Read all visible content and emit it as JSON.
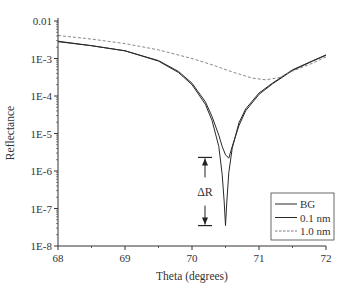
{
  "chart_data": {
    "type": "line",
    "title": "",
    "xlabel": "Theta (degrees)",
    "ylabel": "Reflectance",
    "xlim": [
      68,
      72
    ],
    "ylim": [
      1e-08,
      0.01
    ],
    "yscale": "log",
    "x_ticks": [
      68,
      69,
      70,
      71,
      72
    ],
    "x_tick_labels": [
      "68",
      "69",
      "70",
      "71",
      "72"
    ],
    "y_ticks": [
      0.01,
      0.001,
      0.0001,
      1e-05,
      1e-06,
      1e-07,
      1e-08
    ],
    "y_tick_labels": [
      "0.01",
      "1E-3",
      "1E-4",
      "1E-5",
      "1E-6",
      "1E-7",
      "1E-8"
    ],
    "grid": false,
    "legend_position": "lower right",
    "series": [
      {
        "name": "BG",
        "style": "solid",
        "x": [
          68,
          68.5,
          69,
          69.5,
          69.8,
          70,
          70.2,
          70.3,
          70.4,
          70.45,
          70.48,
          70.5,
          70.52,
          70.55,
          70.6,
          70.7,
          70.8,
          71,
          71.2,
          71.5,
          71.8,
          72
        ],
        "y": [
          0.0028,
          0.0022,
          0.0016,
          0.00085,
          0.00042,
          0.0002,
          6e-05,
          2.2e-05,
          4.5e-06,
          8e-07,
          1.5e-07,
          3.5e-08,
          1.5e-07,
          9e-07,
          4e-06,
          1.9e-05,
          4.5e-05,
          0.00012,
          0.00022,
          0.0005,
          0.00087,
          0.00125
        ]
      },
      {
        "name": "0.1 nm",
        "style": "solid",
        "x": [
          68,
          68.5,
          69,
          69.5,
          69.8,
          70,
          70.2,
          70.3,
          70.4,
          70.45,
          70.5,
          70.55,
          70.6,
          70.7,
          70.8,
          71,
          71.2,
          71.5,
          71.8,
          72
        ],
        "y": [
          0.0029,
          0.0022,
          0.0016,
          0.00088,
          0.00045,
          0.00022,
          7e-05,
          2.8e-05,
          9e-06,
          4.5e-06,
          2.7e-06,
          2.2e-06,
          4.5e-06,
          1.6e-05,
          4e-05,
          0.00011,
          0.00021,
          0.00048,
          0.00085,
          0.00122
        ]
      },
      {
        "name": "1.0 nm",
        "style": "dashed",
        "x": [
          68,
          68.5,
          69,
          69.5,
          70,
          70.3,
          70.6,
          70.9,
          71.1,
          71.3,
          71.5,
          71.8,
          72
        ],
        "y": [
          0.0041,
          0.0033,
          0.0025,
          0.0017,
          0.001,
          0.00068,
          0.00044,
          0.0003,
          0.00027,
          0.00031,
          0.00046,
          0.00075,
          0.0011
        ]
      }
    ],
    "annotations": [
      {
        "text": "ΔR",
        "type": "double-arrow",
        "x": 70.05,
        "y_top": 2.3e-06,
        "y_bottom": 3.5e-08
      }
    ]
  },
  "legend": {
    "items": [
      {
        "label": "BG",
        "style": "solid"
      },
      {
        "label": "0.1 nm",
        "style": "solid"
      },
      {
        "label": "1.0 nm",
        "style": "dashed"
      }
    ]
  },
  "annotation": {
    "label": "ΔR"
  },
  "colors": {
    "line": "#2a2a2a",
    "dashed": "#7a7a7a",
    "axis": "#333333"
  }
}
